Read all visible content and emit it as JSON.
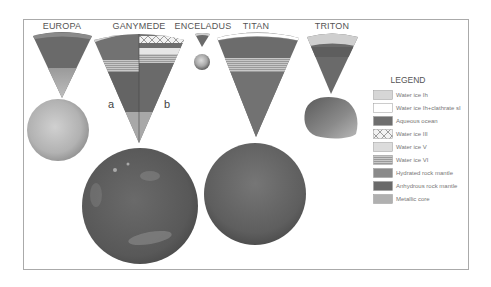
{
  "figure": {
    "moons": [
      {
        "name": "EUROPA"
      },
      {
        "name": "GANYMEDE",
        "panels": [
          "a",
          "b"
        ]
      },
      {
        "name": "ENCELADUS"
      },
      {
        "name": "TITAN"
      },
      {
        "name": "TRITON"
      }
    ],
    "legend": {
      "title": "LEGEND",
      "items": [
        {
          "label": "Water ice Ih",
          "swatch": "#d6d6d6"
        },
        {
          "label": "Water ice Ih+clathrate sI",
          "swatch": "#ffffff"
        },
        {
          "label": "Aqueous ocean",
          "swatch": "#6e6e6e"
        },
        {
          "label": "Water ice III",
          "swatch": "crosshatch"
        },
        {
          "label": "Water ice V",
          "swatch": "#dcdcdc"
        },
        {
          "label": "Water ice VI",
          "swatch": "stripes"
        },
        {
          "label": "Hydrated rock mantle",
          "swatch": "#8a8a8a"
        },
        {
          "label": "Anhydrous rock mantle",
          "swatch": "#6a6a6a"
        },
        {
          "label": "Metallic core",
          "swatch": "#b0b0b0"
        }
      ]
    }
  }
}
